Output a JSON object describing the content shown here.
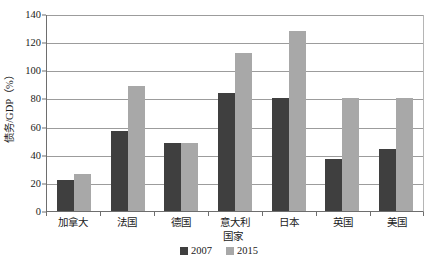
{
  "chart_data": {
    "type": "bar",
    "title": "",
    "xlabel": "国家",
    "ylabel": "债务/GDP（%）",
    "categories": [
      "加拿大",
      "法国",
      "德国",
      "意大利",
      "日本",
      "英国",
      "美国"
    ],
    "series": [
      {
        "name": "2007",
        "color": "#3f3f3f",
        "values": [
          22,
          57,
          48,
          84,
          80,
          37,
          44
        ]
      },
      {
        "name": "2015",
        "color": "#a8a8a8",
        "values": [
          26,
          89,
          48,
          112,
          128,
          80,
          80
        ]
      }
    ],
    "ylim": [
      0,
      140
    ],
    "yticks": [
      0,
      20,
      40,
      60,
      80,
      100,
      120,
      140
    ],
    "ytick_labels": [
      "0",
      "20",
      "40",
      "60",
      "80",
      "100",
      "120",
      "140"
    ],
    "grid": true,
    "legend_position": "bottom"
  },
  "legend": {
    "entries": [
      {
        "label": "2007",
        "color": "#3f3f3f"
      },
      {
        "label": "2015",
        "color": "#a8a8a8"
      }
    ]
  }
}
